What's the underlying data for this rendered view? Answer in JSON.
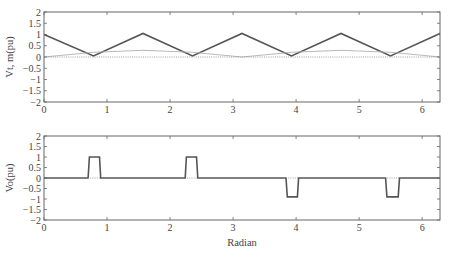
{
  "chart_data": [
    {
      "type": "line",
      "title": "",
      "xlabel": "",
      "ylabel": "Vt, m(pu)",
      "xlim": [
        0,
        6.2832
      ],
      "ylim": [
        -2,
        2
      ],
      "xticks": [
        0,
        1,
        2,
        3,
        4,
        5,
        6
      ],
      "yticks": [
        2,
        1.5,
        1,
        0.5,
        0,
        -0.5,
        -1,
        -1.5,
        -2
      ],
      "ytick_labels": [
        "2",
        "1.5",
        "1",
        "0.5",
        "0",
        "-0.5",
        "-1",
        "-1.5",
        "-2"
      ],
      "grid": false,
      "legend": null,
      "series": [
        {
          "name": "Vt (triangular carrier)",
          "style": "solid-thick",
          "color": "#555555",
          "x": [
            0,
            0.7854,
            1.5708,
            2.3562,
            3.1416,
            3.927,
            4.7124,
            5.4978,
            6.2832
          ],
          "y": [
            1.0,
            0.05,
            1.05,
            0.05,
            1.05,
            0.05,
            1.05,
            0.05,
            1.05
          ]
        },
        {
          "name": "m (modulating signal)",
          "style": "solid-thin",
          "color": "#b0b0b0",
          "x": [
            0,
            0.7854,
            1.5708,
            2.3562,
            3.1416,
            3.927,
            4.7124,
            5.4978,
            6.2832
          ],
          "y": [
            0.0,
            0.21,
            0.3,
            0.21,
            0.0,
            0.21,
            0.3,
            0.21,
            0.0
          ]
        },
        {
          "name": "zero reference",
          "style": "dotted",
          "color": "#888888",
          "x": [
            0,
            6.2832
          ],
          "y": [
            0,
            0
          ]
        }
      ]
    },
    {
      "type": "line",
      "title": "",
      "xlabel": "Radian",
      "ylabel": "Vo(pu)",
      "xlim": [
        0,
        6.2832
      ],
      "ylim": [
        -2,
        2
      ],
      "xticks": [
        0,
        1,
        2,
        3,
        4,
        5,
        6
      ],
      "yticks": [
        2,
        1.5,
        1,
        0.5,
        0,
        -0.5,
        -1,
        -1.5,
        -2
      ],
      "ytick_labels": [
        "2",
        "1.5",
        "1",
        "0.5",
        "0",
        "-0.5",
        "-1",
        "-1.5",
        "-2"
      ],
      "grid": false,
      "legend": null,
      "series": [
        {
          "name": "Vo (output voltage)",
          "style": "solid-thick",
          "color": "#555555",
          "x": [
            0,
            0.7,
            0.72,
            0.88,
            0.9,
            2.24,
            2.26,
            2.42,
            2.44,
            3.84,
            3.86,
            4.02,
            4.04,
            5.42,
            5.44,
            5.62,
            5.64,
            6.2832
          ],
          "y": [
            0,
            0,
            1.0,
            1.0,
            0,
            0,
            1.0,
            1.0,
            0,
            0,
            -0.9,
            -0.9,
            0,
            0,
            -0.9,
            -0.9,
            0,
            0
          ]
        },
        {
          "name": "zero reference",
          "style": "dotted",
          "color": "#888888",
          "x": [
            0,
            6.2832
          ],
          "y": [
            0,
            0
          ]
        }
      ]
    }
  ],
  "plots": {
    "top": {
      "ylabel": "Vt, m(pu)"
    },
    "bottom": {
      "ylabel": "Vo(pu)",
      "xlabel": "Radian"
    }
  },
  "colors": {
    "axes": "#666666",
    "main_line": "#555555",
    "thin_line": "#b0b0b0",
    "dotted": "#888888"
  }
}
